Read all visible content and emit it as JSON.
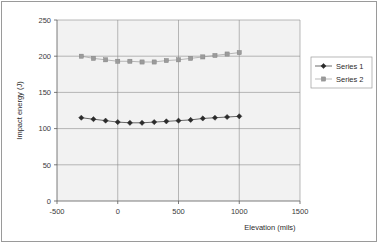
{
  "chart_data": {
    "type": "line",
    "title": "",
    "xlabel": "Elevation (mils)",
    "ylabel": "Impact energy (J)",
    "xlim": [
      -500,
      1500
    ],
    "ylim": [
      0,
      250
    ],
    "xticks": [
      -500,
      0,
      500,
      1000,
      1500
    ],
    "yticks": [
      0,
      50,
      100,
      150,
      200,
      250
    ],
    "xtick_labels": [
      "-500",
      "0",
      "500",
      "1000",
      "1500"
    ],
    "ytick_labels": [
      "0",
      "50",
      "100",
      "150",
      "200",
      "250"
    ],
    "grid": "horizontal-and-vertical",
    "legend_position": "right",
    "x": [
      -300,
      -200,
      -100,
      0,
      100,
      200,
      300,
      400,
      500,
      600,
      700,
      800,
      900,
      1000
    ],
    "series": [
      {
        "name": "Series 1",
        "marker": "diamond",
        "color": "#2b2b2b",
        "values": [
          115,
          113,
          111,
          109,
          108,
          108,
          109,
          110,
          111,
          112,
          114,
          115,
          116,
          117
        ]
      },
      {
        "name": "Series 2",
        "marker": "square",
        "color": "#9b9b9b",
        "values": [
          200,
          197,
          195,
          193,
          193,
          192,
          192,
          194,
          195,
          197,
          199,
          201,
          203,
          205
        ]
      }
    ]
  },
  "legend": {
    "entries": [
      {
        "label": "Series 1"
      },
      {
        "label": "Series 2"
      }
    ]
  },
  "axes": {
    "x_title": "Elevation (mils)",
    "y_title": "Impact energy (J)"
  }
}
